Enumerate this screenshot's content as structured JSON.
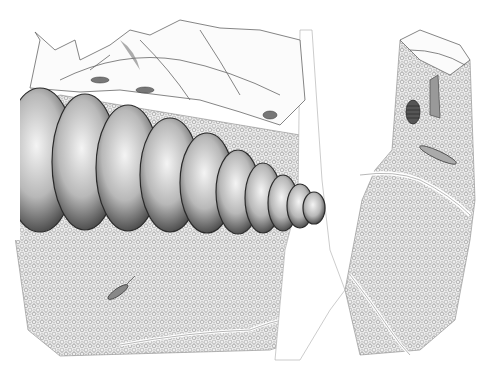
{
  "illustration": {
    "subject": "Pencil drawing of a soil cross-section with an earthworm burrowing beneath leaf litter",
    "style": "graphite pencil, monochrome",
    "elements": [
      {
        "id": "leaf-litter",
        "description": "Layer of decaying leaves across the top"
      },
      {
        "id": "earthworm",
        "description": "Large segmented earthworm body, 10 visible segments, tapering to the right"
      },
      {
        "id": "soil-left",
        "description": "Granular soil block on the left"
      },
      {
        "id": "soil-right",
        "description": "Granular soil block on the right with cracks"
      },
      {
        "id": "root-channel",
        "description": "Vertical pale root/burrow channel between soil blocks"
      },
      {
        "id": "springtail",
        "description": "Small elongated insect in left soil"
      },
      {
        "id": "larva-right",
        "description": "Segmented larva in right soil block"
      },
      {
        "id": "pupa",
        "description": "Dark striped pupa among leaves on right"
      },
      {
        "id": "mites",
        "description": "Small arthropods among the leaf litter"
      }
    ],
    "worm_segments": 10,
    "colors": {
      "paper": "#ffffff",
      "graphite_dark": "#2a2a2a",
      "graphite_mid": "#7a7a7a",
      "graphite_light": "#c8c8c8",
      "soil_tone": "#d9d9d9"
    }
  }
}
